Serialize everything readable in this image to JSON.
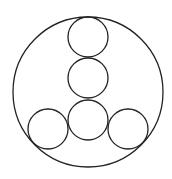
{
  "diagram": {
    "width": 172,
    "height": 179,
    "stroke_color": "#222222",
    "background": "#ffffff",
    "outer_circle": {
      "cx": 88,
      "cy": 92,
      "r": 75
    },
    "inner_circles": [
      {
        "name": "top",
        "cx": 88,
        "cy": 37,
        "r": 20
      },
      {
        "name": "middle",
        "cx": 88,
        "cy": 78,
        "r": 20
      },
      {
        "name": "bottom-center",
        "cx": 88,
        "cy": 120,
        "r": 20
      },
      {
        "name": "bottom-left",
        "cx": 48,
        "cy": 129,
        "r": 20
      },
      {
        "name": "bottom-right",
        "cx": 128,
        "cy": 129,
        "r": 20
      }
    ]
  }
}
